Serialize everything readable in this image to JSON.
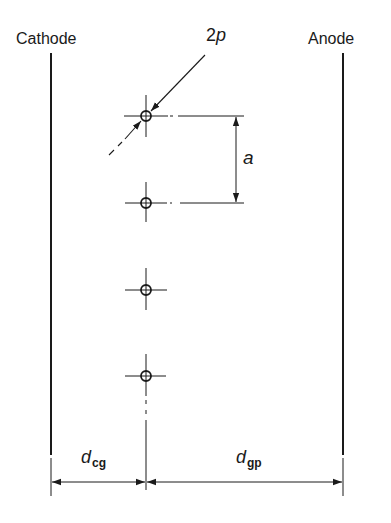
{
  "diagram": {
    "electrodes": [
      {
        "id": "cathode",
        "label": "Cathode"
      },
      {
        "id": "anode",
        "label": "Anode"
      }
    ],
    "grid_wires": {
      "count": 4
    },
    "dimensions": {
      "wire_diameter": {
        "base": "2",
        "var": "p",
        "label": "2p"
      },
      "wire_pitch": {
        "label": "a"
      },
      "cathode_grid_distance": {
        "base": "d",
        "sub": "cg",
        "label": "d_cg"
      },
      "grid_plate_distance": {
        "base": "d",
        "sub": "gp",
        "label": "d_gp"
      }
    },
    "colors": {
      "ink": "#1a1a1a",
      "background": "#ffffff"
    }
  }
}
